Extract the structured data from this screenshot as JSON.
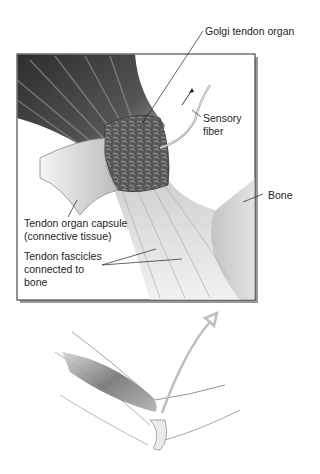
{
  "figure": {
    "labels": {
      "golgi_tendon_organ": "Golgi tendon organ",
      "sensory_fiber_line1": "Sensory",
      "sensory_fiber_line2": "fiber",
      "bone": "Bone",
      "capsule_line1": "Tendon organ capsule",
      "capsule_line2": "(connective tissue)",
      "fascicles_line1": "Tendon fascicles",
      "fascicles_line2": "connected to",
      "fascicles_line3": "bone"
    },
    "panels": [
      {
        "id": "detail",
        "description": "Magnified inset of muscle-tendon junction with Golgi tendon organ"
      },
      {
        "id": "arm",
        "description": "Arm sketch showing biceps and elbow with upward arrow"
      }
    ],
    "colors": {
      "frame": "#555555",
      "muscle_dark": "#3a3a3a",
      "organ": "#5a5a5a",
      "tendon_light": "#d8d8d8",
      "text": "#1e1e1e"
    }
  }
}
